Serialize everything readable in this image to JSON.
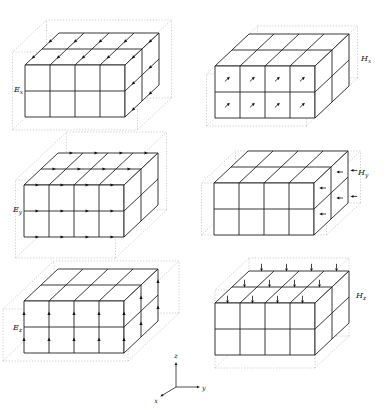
{
  "figure": {
    "panels": [
      {
        "id": "Ex",
        "base": "E",
        "sub": "x",
        "arrow_style": "arrowheads-on-x-edges"
      },
      {
        "id": "Hx",
        "base": "H",
        "sub": "x",
        "arrow_style": "arrows-on-front-face-centers"
      },
      {
        "id": "Ey",
        "base": "E",
        "sub": "y",
        "arrow_style": "arrowheads-on-y-edges"
      },
      {
        "id": "Hy",
        "base": "H",
        "sub": "y",
        "arrow_style": "arrows-on-right-face-centers"
      },
      {
        "id": "Ez",
        "base": "E",
        "sub": "z",
        "arrow_style": "arrowheads-on-z-edges"
      },
      {
        "id": "Hz",
        "base": "H",
        "sub": "z",
        "arrow_style": "arrows-on-top-face"
      }
    ],
    "axes": {
      "x": "x",
      "y": "y",
      "z": "z"
    },
    "grid": {
      "ny": 4,
      "nx": 2,
      "nz": 2
    },
    "colors": {
      "line": "#222222",
      "ghost": "#ababab",
      "arrow": "#111111",
      "background": "#ffffff"
    }
  }
}
